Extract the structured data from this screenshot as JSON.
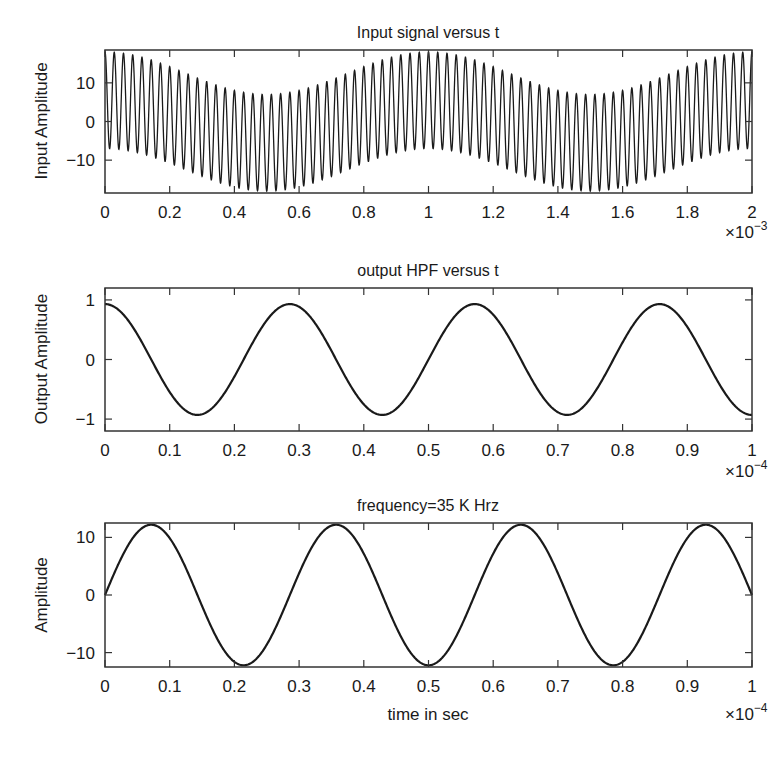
{
  "chart_data": [
    {
      "type": "line",
      "title": "Input signal versus t",
      "xlabel": "",
      "ylabel": "Input Amplitude",
      "x_multiplier": "×10^-3",
      "xlim": [
        0,
        2
      ],
      "ylim": [
        -18.5,
        18.5
      ],
      "xticks": [
        "0",
        "0.2",
        "0.4",
        "0.6",
        "0.8",
        "1",
        "1.2",
        "1.4",
        "1.6",
        "1.8",
        "2"
      ],
      "yticks": [
        "10",
        "0",
        "−10"
      ],
      "ytick_values": [
        10,
        0,
        -10
      ],
      "grid": false,
      "series": [
        {
          "name": "input",
          "model": "12.5*cos(2*pi*35000*t) + 5.5*cos(2*pi*1000*t)",
          "carrier_freq_hz": 35000,
          "carrier_amplitude": 12.5,
          "offset_freq_hz": 1000,
          "offset_amplitude": 5.5
        }
      ]
    },
    {
      "type": "line",
      "title": "output HPF versus t",
      "xlabel": "",
      "ylabel": "Output Amplitude",
      "x_multiplier": "×10^-4",
      "xlim": [
        0,
        1
      ],
      "ylim": [
        -1.2,
        1.2
      ],
      "xticks": [
        "0",
        "0.1",
        "0.2",
        "0.3",
        "0.4",
        "0.5",
        "0.6",
        "0.7",
        "0.8",
        "0.9",
        "1"
      ],
      "yticks": [
        "1",
        "0",
        "−1"
      ],
      "ytick_values": [
        1,
        0,
        -1
      ],
      "grid": false,
      "series": [
        {
          "name": "output",
          "model": "0.93*cos(2*pi*35000*t)",
          "freq_hz": 35000,
          "amplitude": 0.93,
          "peaks_x_e4": [
            0,
            0.286,
            0.571,
            0.857
          ],
          "troughs_x_e4": [
            0.143,
            0.429,
            0.714,
            1.0
          ]
        }
      ]
    },
    {
      "type": "line",
      "title": "frequency=35 K Hrz",
      "xlabel": "time in sec",
      "ylabel": "Amplitude",
      "x_multiplier": "×10^-4",
      "xlim": [
        0,
        1
      ],
      "ylim": [
        -12.5,
        12.5
      ],
      "xticks": [
        "0",
        "0.1",
        "0.2",
        "0.3",
        "0.4",
        "0.5",
        "0.6",
        "0.7",
        "0.8",
        "0.9",
        "1"
      ],
      "yticks": [
        "10",
        "0",
        "−10"
      ],
      "ytick_values": [
        10,
        0,
        -10
      ],
      "grid": false,
      "series": [
        {
          "name": "signal",
          "model": "12.2*sin(2*pi*35000*t)",
          "freq_hz": 35000,
          "amplitude": 12.2,
          "peaks_x_e4": [
            0.071,
            0.357,
            0.643,
            0.929
          ],
          "troughs_x_e4": [
            0.214,
            0.5,
            0.786
          ]
        }
      ]
    }
  ],
  "plots": [
    {
      "title": "Input signal versus t",
      "ylabel": "Input Amplitude",
      "xlabel": "",
      "multiplier_base": "×10",
      "multiplier_exp": "−3"
    },
    {
      "title": "output HPF versus t",
      "ylabel": "Output Amplitude",
      "xlabel": "",
      "multiplier_base": "×10",
      "multiplier_exp": "−4"
    },
    {
      "title": "frequency=35 K Hrz",
      "ylabel": "Amplitude",
      "xlabel": "time in sec",
      "multiplier_base": "×10",
      "multiplier_exp": "−4"
    }
  ],
  "colors": {
    "line": "#1a1a1a",
    "frame": "#333333",
    "background": "#ffffff"
  }
}
